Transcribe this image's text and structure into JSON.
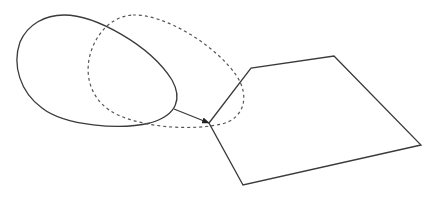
{
  "diagram": {
    "width": 437,
    "height": 197,
    "background": "#ffffff",
    "stroke_color": "#3a3a3a",
    "dashed_color": "#555555",
    "shapes": {
      "solid_loop": {
        "style": "solid",
        "path": "M 64 15 C 95 15, 150 45, 172 80 C 182 98, 178 115, 150 123 C 120 130, 65 126, 42 108 C 20 92, 12 65, 20 42 C 28 24, 45 15, 64 15 Z"
      },
      "dashed_ellipse": {
        "style": "dashed",
        "path": "M 133 15 C 165 14, 215 45, 236 75 C 250 95, 245 118, 222 124 C 195 130, 150 129, 118 115 C 92 103, 84 78, 90 55 C 96 33, 112 16, 133 15 Z"
      },
      "arrow": {
        "x1": 174,
        "y1": 109,
        "x2": 209,
        "y2": 123
      },
      "polygon": {
        "points": [
          [
            209,
            123
          ],
          [
            251,
            68
          ],
          [
            334,
            56
          ],
          [
            421,
            145
          ],
          [
            243,
            185
          ]
        ]
      }
    }
  }
}
